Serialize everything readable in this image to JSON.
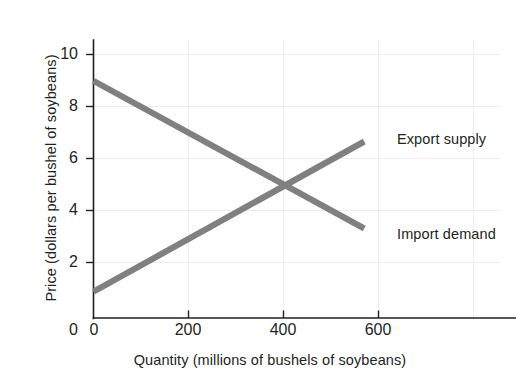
{
  "chart_data": {
    "type": "line",
    "title": "",
    "subtitle": "",
    "xlabel": "Quantity (millions of bushels of soybeans)",
    "ylabel": "Price (dollars per bushel of soybeans)",
    "xlim": [
      0,
      720
    ],
    "ylim": [
      0,
      11
    ],
    "xticks": [
      0,
      200,
      400,
      600
    ],
    "yticks": [
      0,
      2,
      4,
      6,
      8,
      10
    ],
    "xtick_labels": [
      "0",
      "200",
      "400",
      "600"
    ],
    "ytick_labels": [
      "0",
      "2",
      "4",
      "6",
      "8",
      "10"
    ],
    "grid": "faint vertical and horizontal gridlines",
    "legend_position": "inline annotations at right end of each line",
    "series": [
      {
        "name": "Export supply",
        "label": "Export supply",
        "color": "#808080",
        "x": [
          0,
          570
        ],
        "y": [
          1.0,
          6.7
        ],
        "description": "upward sloping line"
      },
      {
        "name": "Import demand",
        "label": "Import demand",
        "color": "#808080",
        "x": [
          0,
          570
        ],
        "y": [
          9.0,
          3.4
        ],
        "description": "downward sloping line"
      }
    ],
    "annotations": [
      {
        "name": "equilibrium",
        "x": 400,
        "y": 5.0,
        "text": ""
      }
    ]
  },
  "axes": {
    "y_title": "Price (dollars per bushel of soybeans)",
    "x_title": "Quantity (millions of bushels of soybeans)",
    "y_tick_labels": [
      "10",
      "8",
      "6",
      "4",
      "2",
      "0"
    ],
    "x_tick_labels": [
      "0",
      "200",
      "400",
      "600"
    ]
  },
  "labels": {
    "export_supply": "Export supply",
    "import_demand": "Import demand"
  },
  "colors": {
    "line": "#808080",
    "axis": "#231f20",
    "grid": "#e8e8e8",
    "text": "#231f20",
    "background": "#ffffff"
  }
}
